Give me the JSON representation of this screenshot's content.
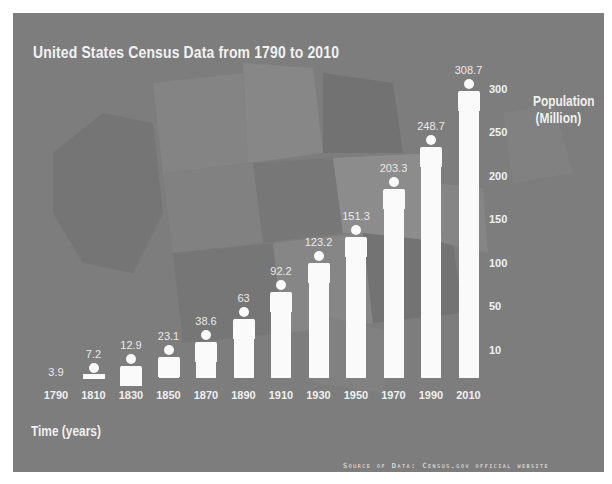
{
  "title": "United States Census Data from 1790 to 2010",
  "y_axis_label_line1": "Population",
  "y_axis_label_line2": "(Million)",
  "x_axis_label": "Time (years)",
  "source": "Source of Data: Census.gov official website",
  "y_ticks": [
    "300",
    "250",
    "200",
    "150",
    "100",
    "50",
    "10"
  ],
  "colors": {
    "background": "#7d7d7d",
    "figure": "#fafafa",
    "text": "#f0f0f0"
  },
  "chart_data": {
    "type": "bar",
    "title": "United States Census Data from 1790 to 2010",
    "xlabel": "Time (years)",
    "ylabel": "Population (Million)",
    "categories": [
      "1790",
      "1810",
      "1830",
      "1850",
      "1870",
      "1890",
      "1910",
      "1930",
      "1950",
      "1970",
      "1990",
      "2010"
    ],
    "values": [
      3.9,
      7.2,
      12.9,
      23.1,
      38.6,
      63,
      92.2,
      123.2,
      151.3,
      203.3,
      248.7,
      308.7
    ],
    "value_labels": [
      "3.9",
      "7.2",
      "12.9",
      "23.1",
      "38.6",
      "63",
      "92.2",
      "123.2",
      "151.3",
      "203.3",
      "248.7",
      "308.7"
    ],
    "y_ticks": [
      10,
      50,
      100,
      150,
      200,
      250,
      300
    ],
    "ylim": [
      0,
      320
    ],
    "grid": false,
    "legend": "none",
    "y_axis_position": "right",
    "bar_style": "pictograph-person",
    "annotation": "Source of Data: Census.gov official website"
  }
}
